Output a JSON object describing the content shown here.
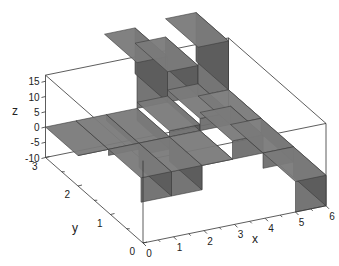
{
  "chart_data": {
    "type": "bar3d",
    "title": "",
    "xlabel": "x",
    "ylabel": "y",
    "zlabel": "z",
    "xlim": [
      0,
      6
    ],
    "ylim": [
      0,
      3
    ],
    "zlim": [
      -10,
      17
    ],
    "x_ticks": [
      "0",
      "1",
      "2",
      "3",
      "4",
      "5",
      "6"
    ],
    "y_ticks": [
      "0",
      "1",
      "2",
      "3"
    ],
    "z_ticks": [
      "-10",
      "-5",
      "0",
      "5",
      "10",
      "15"
    ],
    "grid": false,
    "bar_color": "#707070",
    "bars": [
      {
        "x": 0,
        "y": 2,
        "z": 0
      },
      {
        "x": 1,
        "y": 2,
        "z": -2
      },
      {
        "x": 2,
        "y": 2,
        "z": -4
      },
      {
        "x": 3,
        "y": 2,
        "z": 2
      },
      {
        "x": 4,
        "y": 2,
        "z": 4
      },
      {
        "x": 5,
        "y": 2,
        "z": 0
      },
      {
        "x": 1,
        "y": 1,
        "z": -8
      },
      {
        "x": 2,
        "y": 1,
        "z": -8
      },
      {
        "x": 3,
        "y": 1,
        "z": 0
      },
      {
        "x": 4,
        "y": 1,
        "z": 6
      },
      {
        "x": 5,
        "y": 1,
        "z": -5
      },
      {
        "x": 5,
        "y": 0,
        "z": -10
      },
      {
        "x": 3,
        "y": 3,
        "z": 15
      },
      {
        "x": 4,
        "y": 3,
        "z": 10
      },
      {
        "x": 5,
        "y": 3,
        "z": 16
      }
    ]
  }
}
